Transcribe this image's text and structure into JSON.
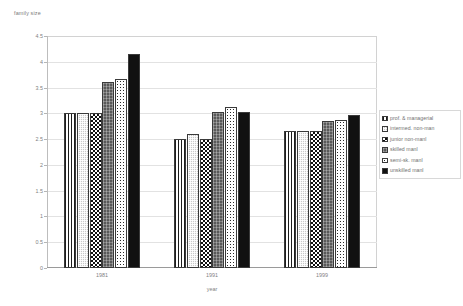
{
  "chart_data": {
    "type": "bar",
    "title": "",
    "ylabel": "family size",
    "xlabel": "year",
    "categories": [
      "1981",
      "1991",
      "1999"
    ],
    "ylim": [
      0,
      4.5
    ],
    "ytick_labels": [
      "0",
      "0.5",
      "1",
      "1.5",
      "2",
      "2.5",
      "3",
      "3.5",
      "4",
      "4.5"
    ],
    "ytick_values": [
      0,
      0.5,
      1,
      1.5,
      2,
      2.5,
      3,
      3.5,
      4,
      4.5
    ],
    "grid": true,
    "legend_position": "right",
    "series": [
      {
        "name": "prof. & managerial",
        "pattern": "vertical-lines",
        "values": [
          3.0,
          2.51,
          2.65
        ]
      },
      {
        "name": "intermed. non-man",
        "pattern": "light-gray",
        "values": [
          3.0,
          2.6,
          2.65
        ]
      },
      {
        "name": "junior non-manl",
        "pattern": "checkerboard",
        "values": [
          3.0,
          2.51,
          2.65
        ]
      },
      {
        "name": "skilled manl",
        "pattern": "dark-gray",
        "values": [
          3.6,
          3.03,
          2.85
        ]
      },
      {
        "name": "semi-sk. manl",
        "pattern": "dotted",
        "values": [
          3.67,
          3.12,
          2.87
        ]
      },
      {
        "name": "unskilled manl",
        "pattern": "solid-black",
        "values": [
          4.15,
          3.02,
          2.97
        ]
      }
    ]
  },
  "legend": {
    "items": [
      {
        "label": "prof. & managerial"
      },
      {
        "label": "intermed. non-man"
      },
      {
        "label": "junior non-manl"
      },
      {
        "label": "skilled manl"
      },
      {
        "label": "semi-sk. manl"
      },
      {
        "label": "unskilled manl"
      }
    ]
  },
  "colors": {
    "grid": "#e2e2e2",
    "axis": "#9a9a9a",
    "text": "#7f7f7f",
    "bar_outline": "#3a3a3a",
    "plot_background": "#ffffff"
  }
}
